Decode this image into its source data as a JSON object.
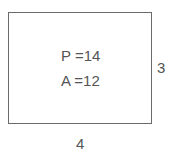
{
  "diagram": {
    "shape": "rectangle",
    "perimeter_label": "P =14",
    "area_label": "A =12",
    "height_label": "3",
    "width_label": "4",
    "colors": {
      "border": "#6a6a6a",
      "text": "#555555",
      "background": "#ffffff"
    }
  }
}
